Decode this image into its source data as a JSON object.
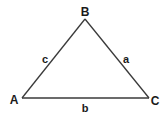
{
  "diagram": {
    "type": "triangle",
    "vertices": [
      {
        "id": "A",
        "label": "A"
      },
      {
        "id": "B",
        "label": "B"
      },
      {
        "id": "C",
        "label": "C"
      }
    ],
    "sides": [
      {
        "id": "a",
        "label": "a",
        "between": [
          "B",
          "C"
        ]
      },
      {
        "id": "b",
        "label": "b",
        "between": [
          "A",
          "C"
        ]
      },
      {
        "id": "c",
        "label": "c",
        "between": [
          "A",
          "B"
        ]
      }
    ],
    "line_color": "#3a3a3a",
    "text_color": "#1a1a1a"
  }
}
